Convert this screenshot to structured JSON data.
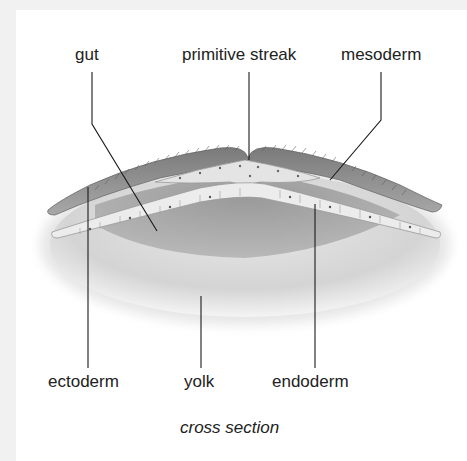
{
  "diagram": {
    "labels": {
      "gut": "gut",
      "primitive_streak": "primitive streak",
      "mesoderm": "mesoderm",
      "ectoderm": "ectoderm",
      "yolk": "yolk",
      "endoderm": "endoderm"
    },
    "caption": "cross section",
    "colors": {
      "background": "#ffffff",
      "border": "#f1f1f1",
      "text": "#222222",
      "leader_line": "#1a1a1a",
      "yolk": "#d9d9d9",
      "gut_cavity": "#a9a9a9",
      "ectoderm": "#8c8c8c",
      "endoderm": "#e6e6e6",
      "mesoderm": "#e0e0e0"
    }
  }
}
